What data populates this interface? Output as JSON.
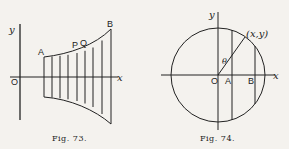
{
  "figures": [
    {
      "caption": "Fig. 73.",
      "labels": {
        "y_axis": "y",
        "x_axis": "x",
        "origin": "O",
        "a": "A",
        "b": "B",
        "p": "P",
        "q": "Q"
      }
    },
    {
      "caption": "Fig. 74.",
      "labels": {
        "y_axis": "y",
        "x_axis": "x",
        "origin": "O",
        "a": "A",
        "b": "B",
        "point": "(x,y)",
        "angle": "θ"
      }
    }
  ],
  "colors": {
    "ink": "#222222",
    "paper": "#f4f2ee"
  }
}
